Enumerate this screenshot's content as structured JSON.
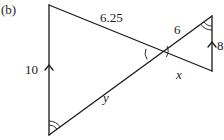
{
  "figure": {
    "label": "(b)"
  },
  "lengths": {
    "left_vertical": "10",
    "top_left_segment": "6.25",
    "top_right_segment": "6",
    "right_vertical": "8",
    "lower_right_segment": "x",
    "lower_left_segment": "y"
  },
  "markings": {
    "parallel_arrows": [
      "left-vertical",
      "right-vertical"
    ],
    "single_arc_angles": [
      "intersection-left",
      "intersection-right"
    ],
    "double_arc_angles": [
      "bottom-left-vertex",
      "top-right-vertex"
    ]
  },
  "colors": {
    "stroke": "#1a1a1a",
    "background": "#ffffff"
  }
}
